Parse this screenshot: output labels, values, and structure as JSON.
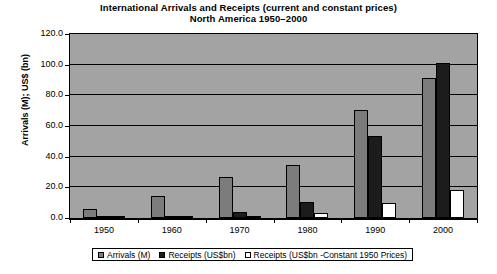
{
  "chart_data": {
    "type": "bar",
    "title": "International Arrivals and Receipts (current and constant prices)",
    "subtitle": "North America 1950–2000",
    "xlabel": "",
    "ylabel": "Arrivals (M); US$ (bn)",
    "categories": [
      "1950",
      "1960",
      "1970",
      "1980",
      "1990",
      "2000"
    ],
    "series": [
      {
        "name": "Arrivals (M)",
        "color": "#7c7c7c",
        "values": [
          6.2,
          14.5,
          27.0,
          34.5,
          70.7,
          91.0
        ]
      },
      {
        "name": "Receipts (US$bn)",
        "color": "#1c1c1c",
        "values": [
          0.7,
          1.0,
          4.0,
          10.5,
          53.8,
          101.0
        ]
      },
      {
        "name": "Receipts (US$bn -Constant 1950 Prices)",
        "color": "#ffffff",
        "values": [
          0.7,
          0.8,
          1.5,
          3.0,
          10.0,
          18.0
        ]
      }
    ],
    "ylim": [
      0,
      120
    ],
    "yticks": [
      "0.0",
      "20.0",
      "40.0",
      "60.0",
      "80.0",
      "100.0",
      "120.0"
    ],
    "ytick_values": [
      0,
      20,
      40,
      60,
      80,
      100,
      120
    ],
    "grid": true,
    "legend_position": "bottom",
    "plot_background": "#a3a3a3",
    "page_background": "#ffffff"
  }
}
